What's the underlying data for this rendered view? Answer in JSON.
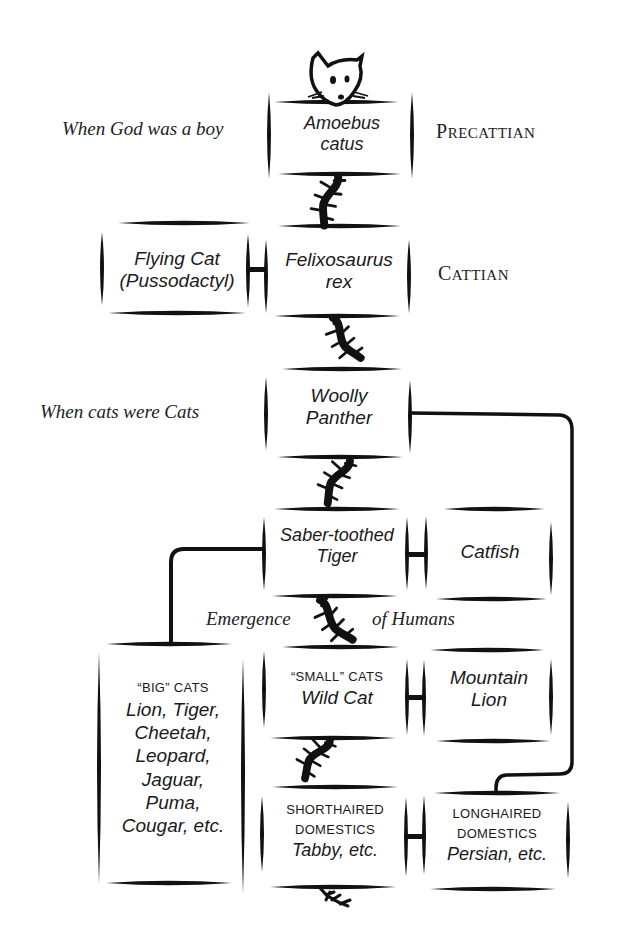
{
  "diagram": {
    "type": "evolutionary-tree",
    "colors": {
      "ink": "#111111",
      "background": "#ffffff"
    },
    "era_labels": [
      {
        "id": "god-boy",
        "text": "When God was a boy"
      },
      {
        "id": "cats-cats",
        "text": "When cats were Cats"
      },
      {
        "id": "emergence",
        "left": "Emergence",
        "right": "of Humans"
      }
    ],
    "periods": [
      {
        "id": "precattian",
        "first": "P",
        "rest": "RECATTIAN"
      },
      {
        "id": "cattian",
        "first": "C",
        "rest": "ATTIAN"
      }
    ],
    "nodes": {
      "amoebus": {
        "line1": "Amoebus",
        "line2": "catus"
      },
      "flying_cat": {
        "line1": "Flying Cat",
        "line2": "(Pussodactyl)"
      },
      "felixosaurus": {
        "line1": "Felixosaurus",
        "line2": "rex"
      },
      "woolly": {
        "line1": "Woolly",
        "line2": "Panther"
      },
      "saber": {
        "line1": "Saber-toothed",
        "line2": "Tiger"
      },
      "catfish": {
        "line1": "Catfish"
      },
      "big_cats": {
        "heading": "“BIG” CATS",
        "lines": [
          "Lion, Tiger,",
          "Cheetah,",
          "Leopard,",
          "Jaguar,",
          "Puma,",
          "Cougar, etc."
        ]
      },
      "small_cats": {
        "heading": "“SMALL” CATS",
        "line1": "Wild Cat"
      },
      "mountain_lion": {
        "line1": "Mountain",
        "line2": "Lion"
      },
      "shorthaired": {
        "heading1": "SHORTHAIRED",
        "heading2": "DOMESTICS",
        "line1": "Tabby, etc."
      },
      "longhaired": {
        "heading1": "LONGHAIRED",
        "heading2": "DOMESTICS",
        "line1": "Persian, etc."
      }
    },
    "icons": [
      "cat-head-icon",
      "cat-tail-icon"
    ]
  }
}
